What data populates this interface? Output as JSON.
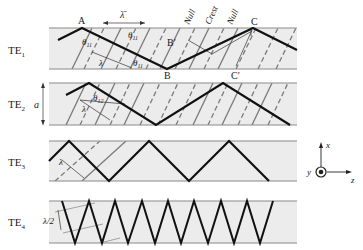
{
  "diagram": {
    "modes": [
      {
        "id": "TE1",
        "label": "TE",
        "sub": "1"
      },
      {
        "id": "TE2",
        "label": "TE",
        "sub": "2"
      },
      {
        "id": "TE3",
        "label": "TE",
        "sub": "3"
      },
      {
        "id": "TE4",
        "label": "TE",
        "sub": "4"
      }
    ],
    "te1_points": {
      "A": "A",
      "B": "B",
      "B_prime": "B′",
      "C": "C",
      "C_prime": "C′"
    },
    "te1_annotations": {
      "lambda_bar": "λ̄",
      "theta_top": "θ",
      "theta_top_sub": "11",
      "theta_a": "θ",
      "theta_a_sub": "11",
      "theta_bottom": "θ",
      "theta_bottom_sub": "11",
      "lambda": "λ"
    },
    "wavefront_labels": [
      "Null",
      "Crest",
      "Null"
    ],
    "te2_annotations": {
      "a": "a",
      "theta": "θ",
      "theta_sub": "12",
      "lambda": "λ"
    },
    "te3_annotations": {
      "lambda": "λ"
    },
    "te4_annotations": {
      "lambda_half": "λ/2"
    },
    "axes": {
      "x": "x",
      "y": "y",
      "z": "z"
    },
    "colors": {
      "guide_fill": "#ececec",
      "guide_border": "#8a8a8a",
      "ray": "#111111",
      "wavefront": "#7a7a7a"
    }
  }
}
